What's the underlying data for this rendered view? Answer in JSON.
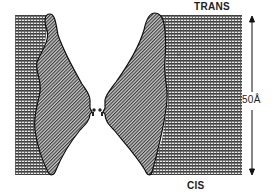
{
  "diagram": {
    "type": "ion channel cross-section in membrane",
    "labels": {
      "top": "TRANS",
      "bottom": "CIS",
      "scale": "50Å",
      "inner": "ν"
    },
    "colors": {
      "membrane_fill": "#555555",
      "protein_fill": "#8a8a8a",
      "outline": "#111111",
      "background": "#ffffff"
    },
    "components": [
      {
        "name": "lipid-bilayer-left",
        "description": "horizontally striped membrane on left"
      },
      {
        "name": "lipid-bilayer-right",
        "description": "horizontally striped membrane on right"
      },
      {
        "name": "channel-protein-left",
        "description": "diagonally hatched left subunit"
      },
      {
        "name": "channel-protein-right",
        "description": "diagonally hatched right subunit"
      },
      {
        "name": "selectivity-filter",
        "description": "narrow constriction at center with small knobs"
      },
      {
        "name": "scale-bar",
        "description": "vertical double-headed arrow spanning membrane thickness"
      }
    ]
  }
}
